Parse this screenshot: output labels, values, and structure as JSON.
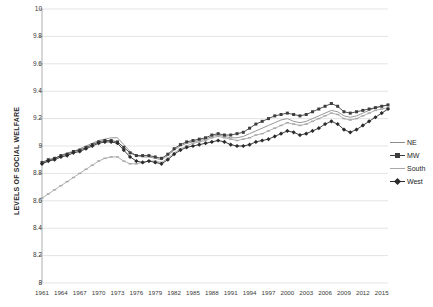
{
  "chart_data": {
    "type": "line",
    "title": "",
    "xlabel": "",
    "ylabel": "LEVELS OF SOCIAL WELFARE",
    "ylim": [
      8,
      10
    ],
    "xlim": [
      1961,
      2016
    ],
    "ytick_labels": [
      "10",
      "9.8",
      "9.6",
      "9.4",
      "9.2",
      "9",
      "8.8",
      "8.6",
      "8.4",
      "8.2",
      "8"
    ],
    "ytick_values": [
      10,
      9.8,
      9.6,
      9.4,
      9.2,
      9,
      8.8,
      8.6,
      8.4,
      8.2,
      8
    ],
    "xtick_labels": [
      "1961",
      "1964",
      "1967",
      "1970",
      "1973",
      "1976",
      "1979",
      "1982",
      "1985",
      "1988",
      "1991",
      "1994",
      "1997",
      "2000",
      "2003",
      "2006",
      "2009",
      "2012",
      "2015"
    ],
    "xtick_values": [
      1961,
      1964,
      1967,
      1970,
      1973,
      1976,
      1979,
      1982,
      1985,
      1988,
      1991,
      1994,
      1997,
      2000,
      2003,
      2006,
      2009,
      2012,
      2015
    ],
    "grid": true,
    "legend_position": "right",
    "x": [
      1961,
      1962,
      1963,
      1964,
      1965,
      1966,
      1967,
      1968,
      1969,
      1970,
      1971,
      1972,
      1973,
      1974,
      1975,
      1976,
      1977,
      1978,
      1979,
      1980,
      1981,
      1982,
      1983,
      1984,
      1985,
      1986,
      1987,
      1988,
      1989,
      1990,
      1991,
      1992,
      1993,
      1994,
      1995,
      1996,
      1997,
      1998,
      1999,
      2000,
      2001,
      2002,
      2003,
      2004,
      2005,
      2006,
      2007,
      2008,
      2009,
      2010,
      2011,
      2012,
      2013,
      2014,
      2015,
      2016
    ],
    "series": [
      {
        "name": "NE",
        "color": "#8c8c8c",
        "marker": "none",
        "values": [
          8.87,
          8.89,
          8.91,
          8.93,
          8.95,
          8.96,
          8.98,
          9.0,
          9.02,
          9.04,
          9.05,
          9.06,
          9.06,
          9.01,
          8.96,
          8.93,
          8.92,
          8.92,
          8.91,
          8.9,
          8.93,
          8.97,
          9.0,
          9.02,
          9.03,
          9.04,
          9.05,
          9.07,
          9.08,
          9.07,
          9.06,
          9.06,
          9.07,
          9.09,
          9.11,
          9.13,
          9.15,
          9.17,
          9.19,
          9.2,
          9.18,
          9.17,
          9.18,
          9.2,
          9.22,
          9.24,
          9.26,
          9.25,
          9.22,
          9.21,
          9.22,
          9.24,
          9.26,
          9.28,
          9.29,
          9.3
        ]
      },
      {
        "name": "MW",
        "color": "#3d3d3d",
        "marker": "square",
        "values": [
          8.88,
          8.9,
          8.91,
          8.93,
          8.94,
          8.96,
          8.97,
          8.99,
          9.01,
          9.03,
          9.04,
          9.04,
          9.03,
          8.99,
          8.95,
          8.93,
          8.93,
          8.93,
          8.92,
          8.91,
          8.94,
          8.98,
          9.01,
          9.03,
          9.04,
          9.05,
          9.06,
          9.08,
          9.09,
          9.08,
          9.08,
          9.09,
          9.1,
          9.13,
          9.16,
          9.18,
          9.2,
          9.22,
          9.23,
          9.24,
          9.23,
          9.22,
          9.23,
          9.25,
          9.27,
          9.29,
          9.31,
          9.29,
          9.25,
          9.24,
          9.25,
          9.26,
          9.27,
          9.28,
          9.29,
          9.3
        ]
      },
      {
        "name": "South",
        "color": "#a8a8a8",
        "marker": "dash",
        "values": [
          8.62,
          8.65,
          8.68,
          8.71,
          8.74,
          8.77,
          8.8,
          8.83,
          8.86,
          8.89,
          8.91,
          8.92,
          8.92,
          8.89,
          8.87,
          8.87,
          8.88,
          8.89,
          8.89,
          8.88,
          8.91,
          8.95,
          8.98,
          9.0,
          9.02,
          9.03,
          9.04,
          9.06,
          9.07,
          9.06,
          9.05,
          9.04,
          9.05,
          9.06,
          9.08,
          9.09,
          9.11,
          9.13,
          9.15,
          9.17,
          9.16,
          9.15,
          9.16,
          9.18,
          9.2,
          9.22,
          9.24,
          9.23,
          9.2,
          9.19,
          9.2,
          9.22,
          9.24,
          9.26,
          9.27,
          9.28
        ]
      },
      {
        "name": "West",
        "color": "#2b2b2b",
        "marker": "diamond",
        "values": [
          8.87,
          8.89,
          8.9,
          8.92,
          8.93,
          8.95,
          8.96,
          8.98,
          9.0,
          9.02,
          9.03,
          9.03,
          9.02,
          8.97,
          8.92,
          8.89,
          8.88,
          8.89,
          8.88,
          8.87,
          8.9,
          8.94,
          8.97,
          8.99,
          9.0,
          9.01,
          9.02,
          9.03,
          9.04,
          9.03,
          9.01,
          9.0,
          9.0,
          9.01,
          9.03,
          9.04,
          9.05,
          9.07,
          9.09,
          9.11,
          9.1,
          9.08,
          9.09,
          9.11,
          9.13,
          9.16,
          9.18,
          9.16,
          9.12,
          9.1,
          9.12,
          9.15,
          9.18,
          9.21,
          9.24,
          9.27
        ]
      }
    ]
  },
  "legend": {
    "items": [
      {
        "label": "NE"
      },
      {
        "label": "MW"
      },
      {
        "label": "South"
      },
      {
        "label": "West"
      }
    ]
  }
}
